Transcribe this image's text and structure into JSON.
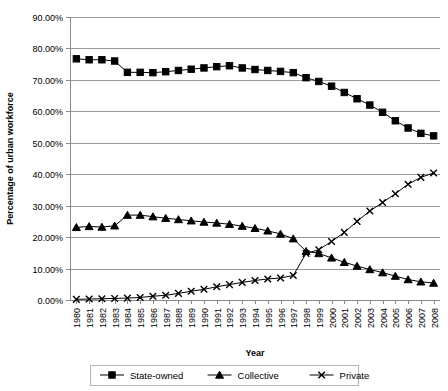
{
  "chart_data": {
    "type": "line",
    "title": "",
    "xlabel": "Year",
    "ylabel": "Percentage of urban workforce",
    "grid": true,
    "legend_position": "bottom",
    "xlim": [
      1980,
      2008
    ],
    "ylim": [
      0,
      0.9
    ],
    "ytick_labels": [
      "90.00%",
      "80.00%",
      "70.00%",
      "60.00%",
      "50.00%",
      "40.00%",
      "30.00%",
      "20.00%",
      "10.00%",
      "0.00%"
    ],
    "ytick_values": [
      0.9,
      0.8,
      0.7,
      0.6,
      0.5,
      0.4,
      0.3,
      0.2,
      0.1,
      0.0
    ],
    "categories": [
      "1980",
      "1981",
      "1982",
      "1983",
      "1984",
      "1985",
      "1986",
      "1987",
      "1988",
      "1989",
      "1990",
      "1991",
      "1992",
      "1993",
      "1994",
      "1995",
      "1996",
      "1997",
      "1998",
      "1999",
      "2000",
      "2001",
      "2002",
      "2003",
      "2004",
      "2005",
      "2006",
      "2007",
      "2008"
    ],
    "series": [
      {
        "name": "State-owned",
        "marker": "square",
        "values": [
          0.767,
          0.764,
          0.764,
          0.76,
          0.724,
          0.724,
          0.723,
          0.726,
          0.73,
          0.734,
          0.738,
          0.742,
          0.745,
          0.738,
          0.733,
          0.73,
          0.727,
          0.723,
          0.707,
          0.695,
          0.68,
          0.66,
          0.64,
          0.62,
          0.597,
          0.57,
          0.547,
          0.53,
          0.522
        ]
      },
      {
        "name": "Collective",
        "marker": "triangle",
        "values": [
          0.231,
          0.234,
          0.232,
          0.236,
          0.27,
          0.27,
          0.265,
          0.26,
          0.256,
          0.252,
          0.248,
          0.245,
          0.241,
          0.235,
          0.228,
          0.22,
          0.21,
          0.195,
          0.155,
          0.148,
          0.134,
          0.12,
          0.108,
          0.097,
          0.087,
          0.076,
          0.065,
          0.058,
          0.054
        ]
      },
      {
        "name": "Private",
        "marker": "x",
        "values": [
          0.002,
          0.003,
          0.004,
          0.005,
          0.006,
          0.008,
          0.012,
          0.015,
          0.021,
          0.028,
          0.034,
          0.042,
          0.049,
          0.056,
          0.062,
          0.067,
          0.07,
          0.078,
          0.148,
          0.16,
          0.186,
          0.215,
          0.25,
          0.283,
          0.31,
          0.338,
          0.368,
          0.39,
          0.404
        ]
      }
    ]
  },
  "legend": {
    "items": [
      {
        "label": "State-owned",
        "marker": "square"
      },
      {
        "label": "Collective",
        "marker": "triangle"
      },
      {
        "label": "Private",
        "marker": "x"
      }
    ]
  },
  "colors": {
    "series": "#000000",
    "grid": "#9a9a9a",
    "axis": "#8a8a8a",
    "background": "#ffffff"
  }
}
